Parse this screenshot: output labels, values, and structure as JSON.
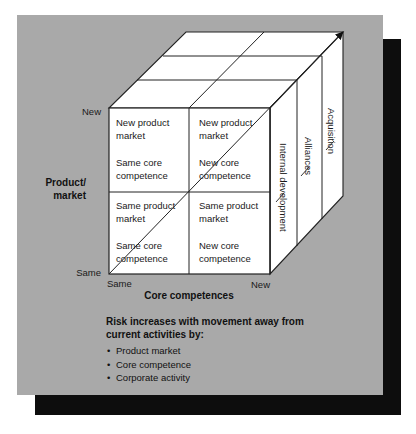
{
  "diagram": {
    "y_axis": {
      "title_line1": "Product/",
      "title_line2": "market",
      "top_label": "New",
      "bottom_label": "Same"
    },
    "x_axis": {
      "title": "Core competences",
      "left_label": "Same",
      "right_label": "New"
    },
    "cells": {
      "top_left": {
        "line1": "New product",
        "line2": "market",
        "line3": "Same core",
        "line4": "competence"
      },
      "top_right": {
        "line1": "New product",
        "line2": "market",
        "line3": "New core",
        "line4": "competence"
      },
      "bottom_left": {
        "line1": "Same product",
        "line2": "market",
        "line3": "Same core",
        "line4": "competence"
      },
      "bottom_right": {
        "line1": "Same product",
        "line2": "market",
        "line3": "New core",
        "line4": "competence"
      }
    },
    "depth_layers": [
      {
        "label": "Internal development"
      },
      {
        "label": "Alliances"
      },
      {
        "label": "Acquisition"
      }
    ],
    "note": {
      "title_line1": "Risk increases with movement away from",
      "title_line2": "current activities by:",
      "bullet_glyph": "•",
      "items": [
        "Product market",
        "Core competence",
        "Corporate activity"
      ]
    },
    "colors": {
      "panel": "#a9a9a9",
      "shadow": "#0d0d0d",
      "cube_face": "#ffffff",
      "line": "#222222"
    }
  }
}
